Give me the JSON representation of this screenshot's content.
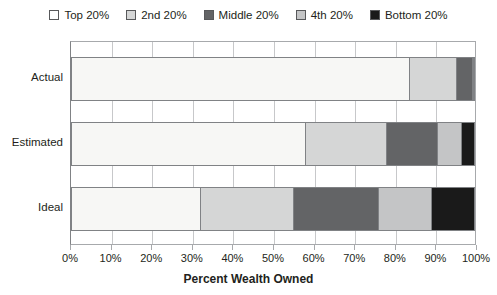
{
  "chart_data": {
    "type": "bar",
    "orientation": "horizontal",
    "stacked": true,
    "stack_mode": "percent",
    "title": "",
    "xlabel": "Percent Wealth Owned",
    "ylabel": "",
    "xlim": [
      0,
      100
    ],
    "xtick_labels": [
      "0%",
      "10%",
      "20%",
      "30%",
      "40%",
      "50%",
      "60%",
      "70%",
      "80%",
      "90%",
      "100%"
    ],
    "xtick_values": [
      0,
      10,
      20,
      30,
      40,
      50,
      60,
      70,
      80,
      90,
      100
    ],
    "grid": true,
    "grid_axis": "x",
    "legend_position": "top",
    "categories": [
      "Actual",
      "Estimated",
      "Ideal"
    ],
    "series": [
      {
        "name": "Top 20%",
        "color": "#f7f7f5",
        "values": [
          84.0,
          58.0,
          32.0
        ]
      },
      {
        "name": "2nd 20%",
        "color": "#d5d6d6",
        "values": [
          11.5,
          20.0,
          23.0
        ]
      },
      {
        "name": "Middle 20%",
        "color": "#636466",
        "values": [
          4.0,
          12.5,
          21.0
        ]
      },
      {
        "name": "4th 20%",
        "color": "#c4c5c6",
        "values": [
          0.3,
          6.0,
          13.0
        ]
      },
      {
        "name": "Bottom 20%",
        "color": "#1a1a1a",
        "values": [
          0.2,
          3.5,
          11.0
        ]
      }
    ]
  },
  "legend": {
    "items": [
      {
        "label": "Top 20%",
        "color": "#ffffff"
      },
      {
        "label": "2nd 20%",
        "color": "#d5d6d6"
      },
      {
        "label": "Middle 20%",
        "color": "#636466"
      },
      {
        "label": "4th 20%",
        "color": "#c4c5c6"
      },
      {
        "label": "Bottom 20%",
        "color": "#1a1a1a"
      }
    ]
  },
  "axes": {
    "x_title": "Percent Wealth Owned",
    "x_ticks": [
      "0%",
      "10%",
      "20%",
      "30%",
      "40%",
      "50%",
      "60%",
      "70%",
      "80%",
      "90%",
      "100%"
    ],
    "y_categories": [
      "Actual",
      "Estimated",
      "Ideal"
    ]
  },
  "colors": {
    "plot_border": "#a7a9ac",
    "gridline": "#c7c8ca",
    "bar_border": "#808285",
    "text": "#231f20",
    "background": "#ffffff"
  }
}
